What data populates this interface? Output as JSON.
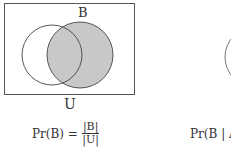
{
  "diagram_left": {
    "set_label": "B",
    "universe_label": "U",
    "formula": {
      "lhs": "Pr(B) =",
      "numerator": "|B|",
      "denominator": "|U|"
    },
    "colors": {
      "shade": "#c8c8c8",
      "stroke": "#444444",
      "frame": "#555555"
    }
  },
  "diagram_right": {
    "formula": {
      "lhs": "Pr(B | A"
    }
  }
}
